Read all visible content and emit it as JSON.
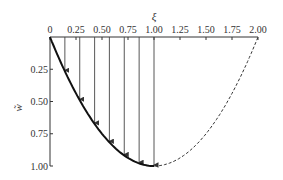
{
  "chart_data": {
    "type": "line",
    "title": "",
    "xlabel": "ξ",
    "ylabel": "w̃",
    "xlim": [
      0,
      2.0
    ],
    "ylim": [
      0,
      1.0
    ],
    "y_inverted": true,
    "x_axis_position": "top",
    "x_ticks": [
      "0",
      "0.25",
      "0.50",
      "0.75",
      "1.00",
      "1.25",
      "1.50",
      "1.75",
      "2.00"
    ],
    "y_ticks": [
      "0.25",
      "0.50",
      "0.75",
      "1.00"
    ],
    "grid": false,
    "series": [
      {
        "name": "deflection (solid)",
        "style": "solid",
        "x": [
          0,
          0.125,
          0.25,
          0.375,
          0.5,
          0.625,
          0.75,
          0.875,
          1.0
        ],
        "values": [
          0,
          0.234,
          0.438,
          0.609,
          0.75,
          0.859,
          0.938,
          0.984,
          1.0
        ]
      },
      {
        "name": "extension (dashed)",
        "style": "dashed",
        "x": [
          1.0,
          1.25,
          1.5,
          1.75,
          2.0
        ],
        "values": [
          1.0,
          0.938,
          0.75,
          0.438,
          0
        ]
      }
    ],
    "arrows": {
      "description": "vertical load arrows from ξ-axis down to curve",
      "x": [
        0.143,
        0.286,
        0.429,
        0.571,
        0.714,
        0.857,
        1.0
      ]
    }
  }
}
